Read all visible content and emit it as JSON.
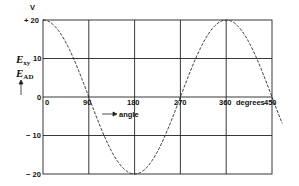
{
  "chart_data": {
    "type": "line",
    "title": "",
    "xlabel": "degrees",
    "ylabel": "E_xy / E_AD",
    "yunit": "V",
    "x_ticks": [
      "0",
      "90",
      "180",
      "270",
      "360",
      "450"
    ],
    "y_ticks": [
      "+20",
      "10",
      "0",
      "-10",
      "-20"
    ],
    "xlim": [
      0,
      450
    ],
    "ylim": [
      -20,
      20
    ],
    "grid": true,
    "legend": null,
    "annotations": [
      "angle"
    ],
    "series": [
      {
        "name": "E_xy (E_AD)",
        "style": "dashed",
        "function": "20*cos(x)",
        "x": [
          0,
          45,
          90,
          135,
          180,
          225,
          270,
          315,
          360,
          405,
          450,
          470
        ],
        "values": [
          20,
          14.1,
          0,
          -14.1,
          -20,
          -14.1,
          0,
          14.1,
          20,
          14.1,
          0,
          -6.8
        ]
      }
    ]
  },
  "labels": {
    "unit": "V",
    "y_top": "+ 20",
    "y_10": "10",
    "y_0": "0",
    "y_m10": "− 10",
    "y_m20": "− 20",
    "x_0": "0",
    "x_90": "90",
    "x_180": "180",
    "x_270": "270",
    "x_360": "360",
    "x_degrees": "degrees",
    "x_450": "450",
    "angle": "angle",
    "ylabel_1": "E",
    "ylabel_1_sub": "xy",
    "ylabel_2": "E",
    "ylabel_2_sub": "AD"
  }
}
